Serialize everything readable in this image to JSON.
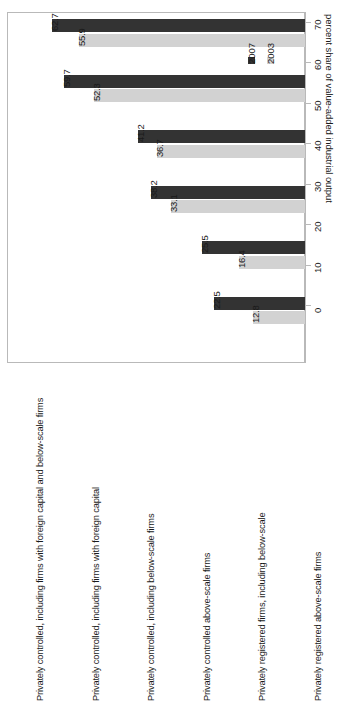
{
  "chart_data": {
    "type": "bar",
    "orientation": "horizontal-rotated",
    "title": "",
    "xlabel": "",
    "ylabel": "percent share of value-added industrial output",
    "ylim": [
      0,
      70
    ],
    "grid": false,
    "legend_position": "top-right",
    "tick_labels": [
      "0",
      "10",
      "20",
      "30",
      "40",
      "50",
      "60",
      "70"
    ],
    "tick_values": [
      0,
      10,
      20,
      30,
      40,
      50,
      60,
      70
    ],
    "categories": [
      "Privately controlled, including firms with foreign capital and below-scale firms",
      "Privately controlled, including firms with foreign capital",
      "Privately controlled, including below-scale firms",
      "Privately controlled above-scale firms",
      "Privately registered firms, including below-scale",
      "Privately registered above-scale firms"
    ],
    "series": [
      {
        "name": "2007",
        "color": "#333333",
        "values": [
          62.7,
          59.7,
          41.2,
          38.2,
          25.5,
          22.5
        ]
      },
      {
        "name": "2003",
        "color": "#d2d2d2",
        "values": [
          55.9,
          52.3,
          36.7,
          33.1,
          16.4,
          12.8
        ]
      }
    ],
    "data_labels": [
      "62.7",
      "55.9",
      "59.7",
      "52.3",
      "41.2",
      "36.7",
      "38.2",
      "33.1",
      "25.5",
      "16.4",
      "22.5",
      "12.8"
    ]
  },
  "legend": {
    "entries": [
      {
        "label": "2007",
        "color": "#333333"
      },
      {
        "label": "2003",
        "color": "#d2d2d2"
      }
    ]
  },
  "axis": {
    "title": "percent share of value-added industrial output"
  }
}
